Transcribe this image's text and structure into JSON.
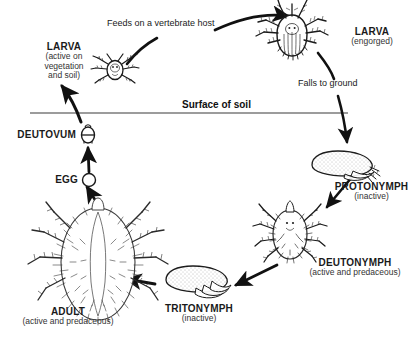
{
  "figure": {
    "soil_label": "Surface of soil",
    "line_color": "#333333",
    "ink_color": "#1a1a1a",
    "background": "#ffffff"
  },
  "transitions": {
    "feeds": "Feeds on a vertebrate host",
    "falls": "Falls to ground"
  },
  "stages": [
    {
      "key": "larva-active",
      "name": "LARVA",
      "sub": "(active on\nvegetation\nand soil)",
      "sub_lines": [
        "(active on",
        "vegetation",
        "and soil)"
      ]
    },
    {
      "key": "larva-engorged",
      "name": "LARVA",
      "sub": "(engorged)",
      "sub_lines": [
        "(engorged)"
      ]
    },
    {
      "key": "protonymph",
      "name": "PROTONYMPH",
      "sub": "(inactive)",
      "sub_lines": [
        "(inactive)"
      ]
    },
    {
      "key": "deutonymph",
      "name": "DEUTONYMPH",
      "sub": "(active and predaceous)",
      "sub_lines": [
        "(active and predaceous)"
      ]
    },
    {
      "key": "tritonymph",
      "name": "TRITONYMPH",
      "sub": "(inactive)",
      "sub_lines": [
        "(inactive)"
      ]
    },
    {
      "key": "adult",
      "name": "ADULT",
      "sub": "(active and predaceous)",
      "sub_lines": [
        "(active and predaceous)"
      ]
    },
    {
      "key": "egg",
      "name": "EGG",
      "sub": "",
      "sub_lines": []
    },
    {
      "key": "deutovum",
      "name": "DEUTOVUM",
      "sub": "",
      "sub_lines": []
    }
  ]
}
